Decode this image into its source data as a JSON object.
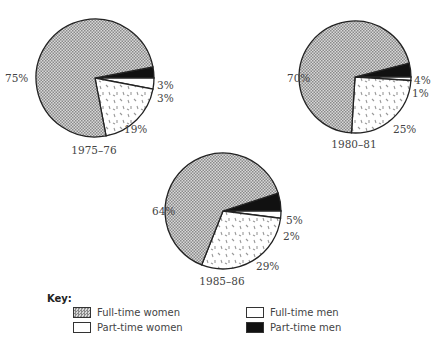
{
  "chart_data": [
    {
      "type": "pie",
      "title": "1975–76",
      "labels": [
        "Full-time women",
        "Part-time women",
        "Full-time men",
        "Part-time men"
      ],
      "values": [
        75,
        19,
        3,
        3
      ],
      "value_labels": [
        "75%",
        "19%",
        "3%",
        "3%"
      ]
    },
    {
      "type": "pie",
      "title": "1980–81",
      "labels": [
        "Full-time women",
        "Part-time women",
        "Full-time men",
        "Part-time men"
      ],
      "values": [
        70,
        25,
        1,
        4
      ],
      "value_labels": [
        "70%",
        "25%",
        "1%",
        "4%"
      ]
    },
    {
      "type": "pie",
      "title": "1985–86",
      "labels": [
        "Full-time women",
        "Part-time women",
        "Full-time men",
        "Part-time men"
      ],
      "values": [
        64,
        29,
        2,
        5
      ],
      "value_labels": [
        "64%",
        "29%",
        "2%",
        "5%"
      ]
    }
  ],
  "pies": [
    {
      "year": "1975–76",
      "fw": "75%",
      "pw": "19%",
      "fm": "3%",
      "pm": "3%"
    },
    {
      "year": "1980–81",
      "fw": "70%",
      "pw": "25%",
      "fm": "1%",
      "pm": "4%"
    },
    {
      "year": "1985–86",
      "fw": "64%",
      "pw": "29%",
      "fm": "2%",
      "pm": "5%"
    }
  ],
  "key": {
    "title": "Key:",
    "full_time_women": "Full-time women",
    "part_time_women": "Part-time women",
    "full_time_men": "Full-time men",
    "part_time_men": "Part-time men"
  }
}
